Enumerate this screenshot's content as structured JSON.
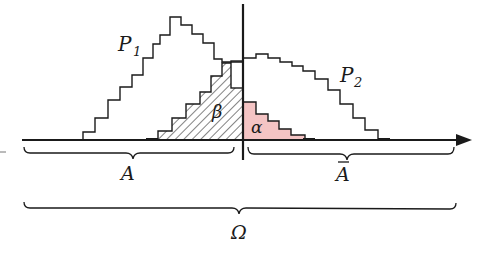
{
  "figure": {
    "title": "",
    "colors": {
      "ink": "#1a1a1a",
      "alpha_fill": "#f4c4c4",
      "background": "#ffffff"
    },
    "labels": {
      "p1": "P",
      "p1_sub": "1",
      "p2": "P",
      "p2_sub": "2",
      "beta": "β",
      "alpha": "α",
      "region_a": "A",
      "region_a_bar": "A",
      "omega": "Ω"
    },
    "distributions": [
      {
        "name": "P1",
        "description": "staircase histogram, peaks left of threshold"
      },
      {
        "name": "P2",
        "description": "staircase histogram, peaks right of threshold"
      }
    ],
    "regions": [
      {
        "name": "beta",
        "description": "hatched area of P2 left of threshold (in A)",
        "pattern": "hatched"
      },
      {
        "name": "alpha",
        "description": "shaded area of P1 right of threshold (in complement of A)",
        "pattern": "pink-fill"
      }
    ],
    "braces": [
      {
        "name": "A",
        "label": "A",
        "span": "left of threshold"
      },
      {
        "name": "A-bar",
        "label": "Ā",
        "span": "right of threshold"
      },
      {
        "name": "Omega",
        "label": "Ω",
        "span": "whole axis"
      }
    ]
  }
}
